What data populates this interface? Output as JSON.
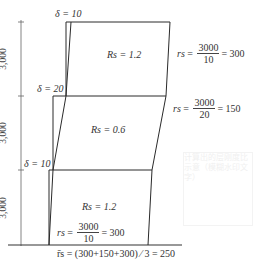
{
  "diagram": {
    "type": "story-drift-frame",
    "dimensions": {
      "story_heights": [
        "3,000",
        "3,000",
        "3,000"
      ]
    },
    "drift_labels": [
      {
        "symbol": "δ",
        "value": "10",
        "text": "δ = 10"
      },
      {
        "symbol": "δ",
        "value": "20",
        "text": "δ = 20"
      },
      {
        "symbol": "δ",
        "value": "10",
        "text": "δ = 10"
      }
    ],
    "stories": [
      {
        "level": "top",
        "rs_label": "Rs = 1.2",
        "rs_var": "rs",
        "numerator": "3000",
        "denominator": "10",
        "result": "= 300"
      },
      {
        "level": "middle",
        "rs_label": "Rs = 0.6",
        "rs_var": "rs",
        "numerator": "3000",
        "denominator": "20",
        "result": "= 150"
      },
      {
        "level": "bottom",
        "rs_label": "Rs = 1.2",
        "rs_var": "rs",
        "numerator": "3000",
        "denominator": "10",
        "result": "= 300"
      }
    ],
    "average_formula": "r̄s = (300+150+300) ⁄ 3 = 250",
    "watermark": "计算出的层刚度比示意（模糊水印文字）",
    "colors": {
      "line": "#2a2a2a",
      "dim_line": "#555555",
      "text": "#333333",
      "background": "#ffffff"
    }
  }
}
